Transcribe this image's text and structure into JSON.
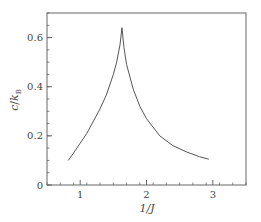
{
  "chart_data": {
    "type": "line",
    "title": "",
    "xlabel": "1/J",
    "ylabel": "c/k_B",
    "xlim": [
      0.5,
      3.5
    ],
    "ylim": [
      0,
      0.7
    ],
    "xticks": [
      1,
      2,
      3
    ],
    "xtick_labels": [
      "1",
      "2",
      "3"
    ],
    "yticks": [
      0,
      0.2,
      0.4,
      0.6
    ],
    "ytick_labels": [
      "0",
      "0.2",
      "0.4",
      "0.6"
    ],
    "x_minor_step": 0.2,
    "y_minor_step": 0.05,
    "grid": false,
    "legend": null,
    "line_color": "#555555",
    "series": [
      {
        "name": "specific heat",
        "x": [
          0.82,
          0.9,
          1.0,
          1.1,
          1.2,
          1.3,
          1.4,
          1.5,
          1.55,
          1.6,
          1.63,
          1.66,
          1.7,
          1.8,
          1.9,
          2.0,
          2.2,
          2.4,
          2.6,
          2.8,
          2.94
        ],
        "y": [
          0.1,
          0.13,
          0.17,
          0.21,
          0.26,
          0.31,
          0.37,
          0.45,
          0.5,
          0.57,
          0.64,
          0.56,
          0.49,
          0.39,
          0.32,
          0.27,
          0.2,
          0.16,
          0.135,
          0.115,
          0.105
        ]
      }
    ]
  },
  "labels": {
    "x_axis": "1/J",
    "y_axis_c": "c",
    "y_axis_slash": "/",
    "y_axis_k": "k",
    "y_axis_sub": "B"
  }
}
